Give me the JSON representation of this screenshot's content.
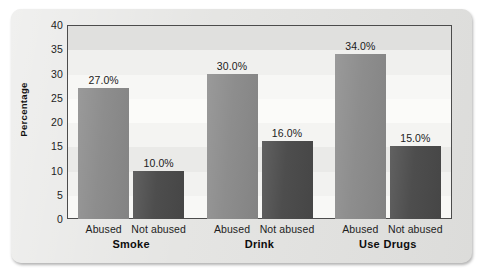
{
  "figure": {
    "background_color": "#e4e4e2",
    "plot_background_color": "#f3f3f1",
    "plot_border_color": "#4c4c4c"
  },
  "chart_data": {
    "type": "bar",
    "title": "",
    "subtitle": "",
    "xlabel": "",
    "ylabel": "Percentage",
    "ylim": [
      0,
      40
    ],
    "y_ticks": [
      0,
      5,
      10,
      15,
      20,
      25,
      30,
      35,
      40
    ],
    "y_tick_labels": [
      "0",
      "5",
      "10",
      "15",
      "20",
      "25",
      "30",
      "35",
      "40"
    ],
    "grid": false,
    "legend_position": "none",
    "categories": [
      "Smoke",
      "Drink",
      "Use Drugs"
    ],
    "subcategories": [
      "Abused",
      "Not abused"
    ],
    "series": [
      {
        "name": "Abused",
        "color": "#8b8b8b",
        "values": [
          27.0,
          30.0,
          34.0
        ],
        "data_labels": [
          "27.0%",
          "30.0%",
          "34.0%"
        ]
      },
      {
        "name": "Not abused",
        "color": "#4a4a4a",
        "values": [
          10.0,
          16.0,
          15.0
        ],
        "data_labels": [
          "10.0%",
          "16.0%",
          "15.0%"
        ]
      }
    ],
    "bars": [
      {
        "group": "Smoke",
        "subcategory": "Abused",
        "value": 27.0,
        "label": "27.0%",
        "color": "#8b8b8b"
      },
      {
        "group": "Smoke",
        "subcategory": "Not abused",
        "value": 10.0,
        "label": "10.0%",
        "color": "#4a4a4a"
      },
      {
        "group": "Drink",
        "subcategory": "Abused",
        "value": 30.0,
        "label": "30.0%",
        "color": "#8b8b8b"
      },
      {
        "group": "Drink",
        "subcategory": "Not abused",
        "value": 16.0,
        "label": "16.0%",
        "color": "#4a4a4a"
      },
      {
        "group": "Use Drugs",
        "subcategory": "Abused",
        "value": 34.0,
        "label": "34.0%",
        "color": "#8b8b8b"
      },
      {
        "group": "Use Drugs",
        "subcategory": "Not abused",
        "value": 15.0,
        "label": "15.0%",
        "color": "#4a4a4a"
      }
    ]
  }
}
